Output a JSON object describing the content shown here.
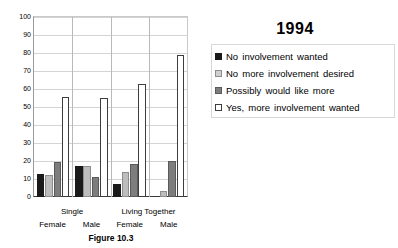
{
  "chart_data": {
    "type": "bar",
    "title": "1994",
    "xlabel": "",
    "ylabel": "",
    "ylim": [
      0,
      100
    ],
    "yticks": [
      0,
      10,
      20,
      30,
      40,
      50,
      60,
      70,
      80,
      90,
      100
    ],
    "grid": true,
    "legend_position": "right",
    "categories": [
      "Single Female",
      "Single Male",
      "Living Together Female",
      "Living Together Male"
    ],
    "group_labels_top": [
      "Single",
      "Living Together"
    ],
    "group_labels_bottom": [
      "Female",
      "Male",
      "Female",
      "Male"
    ],
    "series": [
      {
        "name": "No involvement wanted",
        "color": "#1a1a1a",
        "values": [
          13,
          17,
          7,
          0
        ]
      },
      {
        "name": "No more involvement desired",
        "color": "#bdbdbd",
        "values": [
          12,
          17,
          14,
          3.5
        ]
      },
      {
        "name": "Possibly would like more",
        "color": "#7d7d7d",
        "values": [
          19.5,
          11,
          18.5,
          20
        ]
      },
      {
        "name": "Yes, more involvement wanted",
        "color": "#ffffff",
        "values": [
          55.5,
          55,
          63,
          79
        ]
      }
    ],
    "caption": "Figure 10.3"
  },
  "axis": {
    "y_labels": [
      "100",
      "90",
      "80",
      "70",
      "60",
      "50",
      "40",
      "30",
      "20",
      "10",
      "0"
    ]
  },
  "legend": {
    "items": [
      {
        "label": "No involvement wanted",
        "swatch": "legend-swatch-black"
      },
      {
        "label": "No more involvement desired",
        "swatch": "legend-swatch-light-gray"
      },
      {
        "label": "Possibly would like more",
        "swatch": "legend-swatch-medium-gray"
      },
      {
        "label": "Yes, more involvement wanted",
        "swatch": "legend-swatch-white"
      }
    ]
  },
  "xaxis": {
    "top_row": [
      {
        "label": "Single",
        "center_pct": 25
      },
      {
        "label": "Living Together",
        "center_pct": 74
      }
    ],
    "bottom_row": [
      {
        "label": "Female",
        "center_pct": 12.5
      },
      {
        "label": "Male",
        "center_pct": 37.5
      },
      {
        "label": "Female",
        "center_pct": 62
      },
      {
        "label": "Male",
        "center_pct": 87
      }
    ]
  },
  "caption": {
    "text": "Figure 10.3"
  }
}
